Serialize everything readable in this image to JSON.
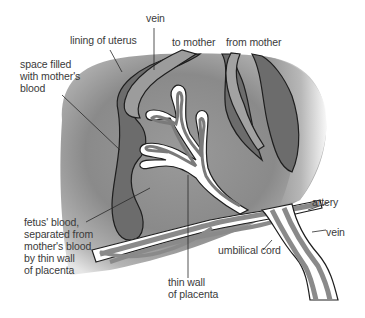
{
  "figure": {
    "colors": {
      "background": "#ffffff",
      "tissue_dark": "#6e6e6e",
      "tissue_mid": "#8e8e8e",
      "tissue_light": "#c8c8c8",
      "vessel_fill": "#9a9a9a",
      "outline": "#1e1e1e",
      "label_text": "#3a3a3a"
    }
  },
  "labels": {
    "vein_top": "vein",
    "lining_of_uterus": "lining of uterus",
    "to_mother": "to mother",
    "from_mother": "from mother",
    "space_filled": "space filled\nwith mother's\nblood",
    "fetus_blood": "fetus' blood,\nseparated from\nmother's blood\nby thin wall\nof placenta",
    "thin_wall": "thin wall\nof placenta",
    "artery": "artery",
    "vein_right": "vein",
    "umbilical_cord": "umbilical cord"
  }
}
